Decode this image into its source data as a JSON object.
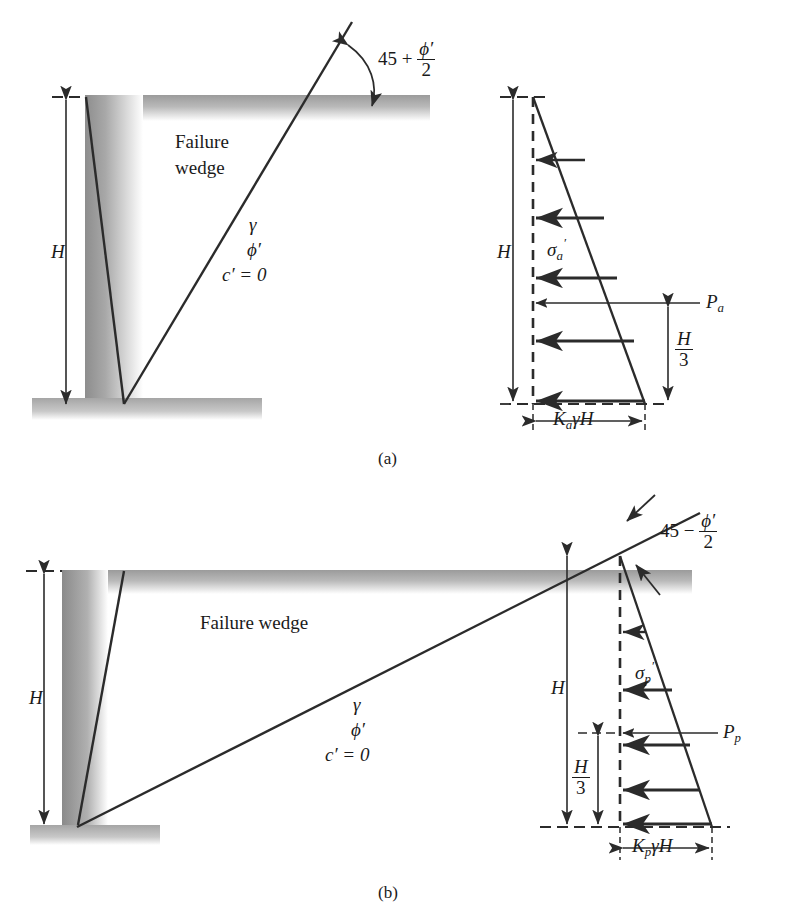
{
  "figure": {
    "title_caption_a": "(a)",
    "title_caption_b": "(b)",
    "panels": [
      {
        "id": "a",
        "caption": "(a)",
        "type": "active-rankine-earth-pressure",
        "wedge_label": "Failure wedge",
        "wedge_label_line1": "Failure",
        "wedge_label_line2": "wedge",
        "angle": {
          "base": "45 +",
          "numerator": "ϕ′",
          "denominator": "2",
          "full": "45 + ϕ′/2"
        },
        "soil": {
          "unit_weight": "γ",
          "friction_angle": "ϕ′",
          "cohesion": "c′ = 0"
        },
        "height_label": "H",
        "stress_symbol": "σ",
        "stress_sub": "a",
        "stress_prime": "′",
        "resultant_label": "P",
        "resultant_sub": "a",
        "lever_arm": {
          "numerator": "H",
          "denominator": "3",
          "full": "H/3"
        },
        "base_pressure": {
          "coef": "K",
          "coef_sub": "a",
          "gamma": "γ",
          "height": "H",
          "full": "KₐγH"
        },
        "arrow_count": 5,
        "arrow_direction": "left"
      },
      {
        "id": "b",
        "caption": "(b)",
        "type": "passive-rankine-earth-pressure",
        "wedge_label": "Failure wedge",
        "angle": {
          "base": "45 −",
          "numerator": "ϕ′",
          "denominator": "2",
          "full": "45 − ϕ′/2"
        },
        "soil": {
          "unit_weight": "γ",
          "friction_angle": "ϕ′",
          "cohesion": "c′ = 0"
        },
        "height_label": "H",
        "stress_symbol": "σ",
        "stress_sub": "p",
        "stress_prime": "′",
        "resultant_label": "P",
        "resultant_sub": "p",
        "lever_arm": {
          "numerator": "H",
          "denominator": "3",
          "full": "H/3"
        },
        "base_pressure": {
          "coef": "K",
          "coef_sub": "p",
          "gamma": "γ",
          "height": "H",
          "full": "KₚγH"
        },
        "arrow_count": 5,
        "arrow_direction": "left"
      }
    ],
    "colors": {
      "line": "#2b2b2b",
      "soil_gray": "#9a9a9a",
      "soil_gray_light": "#cfcfcf",
      "background": "#ffffff",
      "text": "#1a1a1a"
    }
  }
}
